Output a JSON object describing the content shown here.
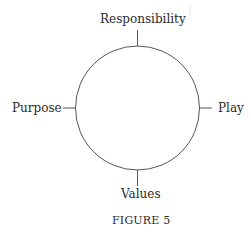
{
  "diagram": {
    "type": "circle-with-four-labels",
    "labels": {
      "top": "Responsibility",
      "right": "Play",
      "bottom": "Values",
      "left": "Purpose"
    },
    "caption": "FIGURE 5",
    "stroke_color": "#555555"
  }
}
